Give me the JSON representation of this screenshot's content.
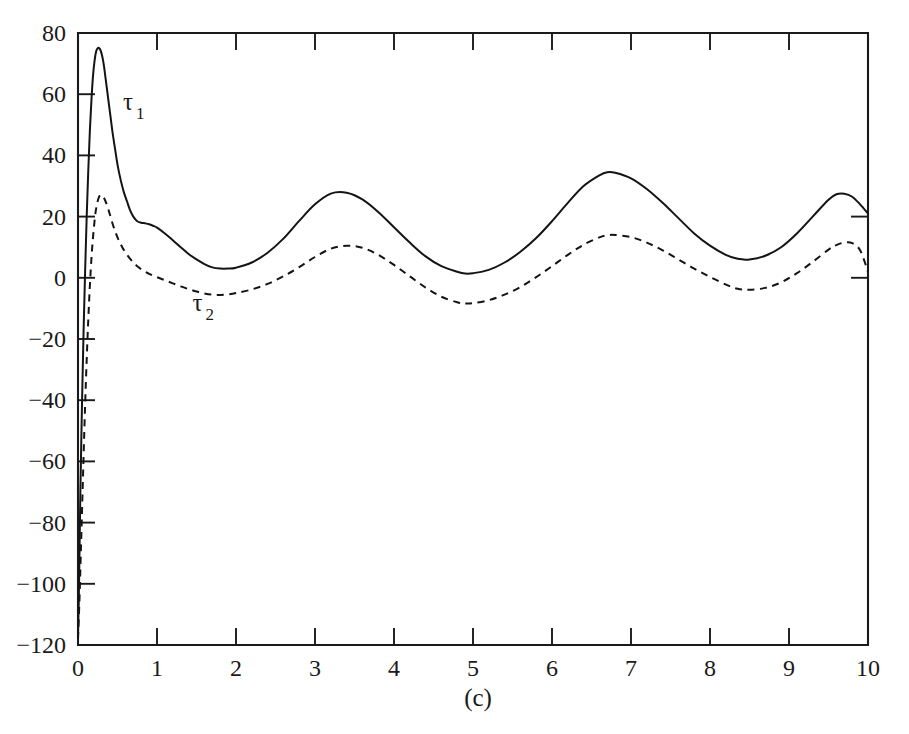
{
  "figure": {
    "caption": "(c)",
    "background_color": "#ffffff",
    "ink_color": "#1a1a1a"
  },
  "annotations": [
    {
      "name": "tau-1",
      "symbol": "τ",
      "subscript": "1",
      "x_data": 0.57,
      "y_data": 55,
      "series": "tau_1"
    },
    {
      "name": "tau-2",
      "symbol": "τ",
      "subscript": "2",
      "x_data": 1.45,
      "y_data": -11,
      "series": "tau_2"
    }
  ],
  "chart_data": {
    "type": "line",
    "title": "",
    "subtitle": "",
    "xlabel": "",
    "ylabel": "",
    "xlim": [
      0,
      10
    ],
    "ylim": [
      -120,
      80
    ],
    "grid": false,
    "legend": "none (inline curve annotations)",
    "xticks": [
      0,
      1,
      2,
      3,
      4,
      5,
      6,
      7,
      8,
      9,
      10
    ],
    "xtick_labels": [
      "0",
      "1",
      "2",
      "3",
      "4",
      "5",
      "6",
      "7",
      "8",
      "9",
      "10"
    ],
    "yticks": [
      -120,
      -100,
      -80,
      -60,
      -40,
      -20,
      0,
      20,
      40,
      60,
      80
    ],
    "ytick_labels": [
      "−120",
      "−100",
      "−80",
      "−60",
      "−40",
      "−20",
      "0",
      "20",
      "40",
      "60",
      "80"
    ],
    "series": [
      {
        "name": "tau_1",
        "style": "solid",
        "label": "τ₁",
        "x": [
          0.0,
          0.01,
          0.02,
          0.03,
          0.05,
          0.07,
          0.09,
          0.11,
          0.13,
          0.15,
          0.17,
          0.19,
          0.21,
          0.23,
          0.25,
          0.27,
          0.29,
          0.31,
          0.33,
          0.35,
          0.38,
          0.41,
          0.44,
          0.47,
          0.5,
          0.54,
          0.58,
          0.62,
          0.66,
          0.7,
          0.75,
          0.8,
          0.85,
          0.9,
          0.95,
          1.0,
          1.1,
          1.2,
          1.3,
          1.4,
          1.5,
          1.6,
          1.7,
          1.8,
          1.9,
          2.0,
          2.2,
          2.4,
          2.6,
          2.8,
          3.0,
          3.2,
          3.4,
          3.6,
          3.8,
          4.0,
          4.2,
          4.4,
          4.6,
          4.8,
          4.9,
          5.0,
          5.2,
          5.4,
          5.6,
          5.8,
          6.0,
          6.2,
          6.4,
          6.6,
          6.7,
          6.8,
          7.0,
          7.2,
          7.4,
          7.6,
          7.8,
          8.0,
          8.2,
          8.35,
          8.5,
          8.7,
          8.9,
          9.1,
          9.3,
          9.5,
          9.6,
          9.7,
          9.8,
          9.9,
          10.0
        ],
        "y": [
          -117,
          -105,
          -88,
          -70,
          -42,
          -18,
          2,
          20,
          35,
          48,
          58,
          66,
          71,
          74,
          75,
          75,
          74,
          72,
          69,
          65,
          59,
          53,
          47,
          42,
          37,
          32,
          28,
          25,
          22,
          20,
          18.5,
          18,
          17.8,
          17.5,
          17,
          16.4,
          14.5,
          12.3,
          10.0,
          7.8,
          6.0,
          4.5,
          3.4,
          3.0,
          3.0,
          3.3,
          5.0,
          8.2,
          12.8,
          18.6,
          24.0,
          27.5,
          27.8,
          25.6,
          21.5,
          16.5,
          11.5,
          7.0,
          3.8,
          2.0,
          1.4,
          1.5,
          2.6,
          5.0,
          8.5,
          13.0,
          18.5,
          24.5,
          30.0,
          33.5,
          34.5,
          34.3,
          32.5,
          29.0,
          24.5,
          19.5,
          14.5,
          10.5,
          7.5,
          6.2,
          6.0,
          7.2,
          10.0,
          14.5,
          20.0,
          25.5,
          27.3,
          27.5,
          26.5,
          24.0,
          21.0
        ]
      },
      {
        "name": "tau_2",
        "style": "dashed",
        "label": "τ₂",
        "x": [
          0.0,
          0.02,
          0.04,
          0.06,
          0.08,
          0.1,
          0.12,
          0.14,
          0.16,
          0.18,
          0.2,
          0.22,
          0.24,
          0.26,
          0.28,
          0.3,
          0.32,
          0.34,
          0.37,
          0.4,
          0.44,
          0.48,
          0.52,
          0.56,
          0.6,
          0.65,
          0.7,
          0.75,
          0.8,
          0.85,
          0.9,
          1.0,
          1.1,
          1.2,
          1.3,
          1.4,
          1.5,
          1.6,
          1.7,
          1.8,
          1.9,
          2.0,
          2.2,
          2.4,
          2.6,
          2.8,
          3.0,
          3.2,
          3.4,
          3.6,
          3.8,
          4.0,
          4.2,
          4.4,
          4.6,
          4.8,
          4.9,
          5.0,
          5.2,
          5.4,
          5.6,
          5.8,
          6.0,
          6.2,
          6.4,
          6.6,
          6.7,
          6.8,
          7.0,
          7.2,
          7.4,
          7.6,
          7.8,
          8.0,
          8.2,
          8.35,
          8.5,
          8.7,
          8.9,
          9.1,
          9.3,
          9.5,
          9.6,
          9.7,
          9.8,
          9.9,
          10.0
        ],
        "y": [
          -118,
          -104,
          -86,
          -68,
          -50,
          -34,
          -20,
          -8,
          2,
          10,
          16,
          21,
          24,
          26,
          27,
          27,
          26.5,
          25.5,
          23.5,
          21,
          17.5,
          14.5,
          12,
          10,
          8.3,
          6.5,
          5.0,
          3.8,
          2.8,
          2.0,
          1.3,
          0.2,
          -0.8,
          -1.8,
          -2.8,
          -3.7,
          -4.5,
          -5.1,
          -5.5,
          -5.6,
          -5.4,
          -5.0,
          -3.8,
          -2.0,
          0.5,
          3.5,
          6.8,
          9.5,
          10.5,
          9.8,
          7.5,
          4.2,
          0.5,
          -3.2,
          -6.2,
          -8.0,
          -8.4,
          -8.3,
          -7.3,
          -5.5,
          -3.0,
          0.2,
          3.8,
          7.5,
          10.8,
          13.2,
          13.9,
          14.0,
          13.3,
          11.5,
          9.0,
          6.0,
          3.0,
          0.3,
          -2.2,
          -3.6,
          -3.9,
          -3.3,
          -1.5,
          1.5,
          5.2,
          9.2,
          10.7,
          11.5,
          11.3,
          9.0,
          2.0
        ]
      }
    ]
  }
}
